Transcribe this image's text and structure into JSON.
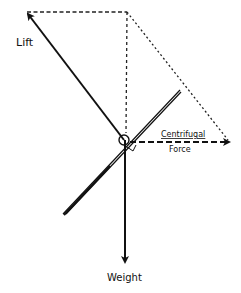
{
  "diagram": {
    "type": "force-vector-diagram",
    "labels": {
      "lift": "Lift",
      "centrifugal_line1": "Centrifugal",
      "centrifugal_line2": "Force",
      "weight": "Weight"
    },
    "vectors": [
      {
        "name": "Lift",
        "direction": "up-left",
        "style": "solid",
        "from": [
          125,
          140
        ],
        "to": [
          27,
          13
        ]
      },
      {
        "name": "Centrifugal Force",
        "direction": "right",
        "style": "dashed",
        "from": [
          125,
          142
        ],
        "to": [
          229,
          142
        ]
      },
      {
        "name": "Weight",
        "direction": "down",
        "style": "solid",
        "from": [
          125,
          140
        ],
        "to": [
          125,
          262
        ]
      }
    ],
    "construction_lines": [
      {
        "from": [
          27,
          12
        ],
        "to": [
          127,
          12
        ],
        "style": "dashed"
      },
      {
        "from": [
          127,
          12
        ],
        "to": [
          127,
          135
        ],
        "style": "dashed"
      },
      {
        "from": [
          127,
          12
        ],
        "to": [
          229,
          142
        ],
        "style": "dashed"
      }
    ],
    "wing": {
      "from": [
        63,
        215
      ],
      "to": [
        180,
        90
      ],
      "style": "double-line"
    },
    "colors": {
      "ink": "#111111",
      "background": "#ffffff"
    }
  }
}
